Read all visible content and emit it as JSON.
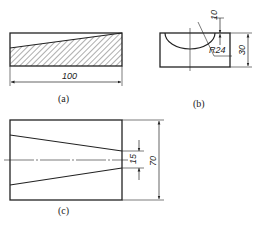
{
  "figures": [
    {
      "id": "a",
      "caption": "(a)",
      "description": "Front view of rectangular block with hatched tapered wedge section",
      "dimensions": {
        "length": "100"
      }
    },
    {
      "id": "b",
      "caption": "(b)",
      "description": "Side view with semicircular cutout",
      "dimensions": {
        "radius": "R24",
        "depth": "10",
        "height": "30"
      }
    },
    {
      "id": "c",
      "caption": "(c)",
      "description": "Top view showing tapered slot",
      "dimensions": {
        "slot_width": "15",
        "width": "70"
      }
    }
  ],
  "colors": {
    "line": "#222222",
    "background": "#ffffff"
  }
}
